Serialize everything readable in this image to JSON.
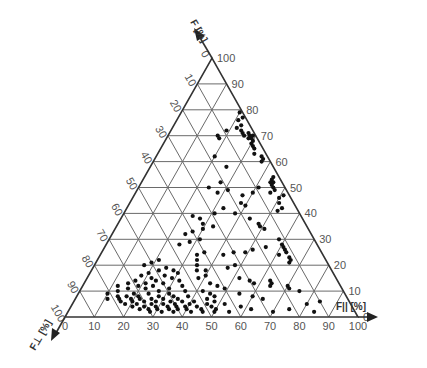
{
  "chart_data": {
    "type": "scatter",
    "subtype": "ternary",
    "title": "",
    "axes": {
      "top": {
        "label": "F",
        "subscript": "",
        "unit": "[%]",
        "ticks": [
          0,
          10,
          20,
          30,
          40,
          50,
          60,
          70,
          80,
          90,
          100
        ]
      },
      "left": {
        "label": "F",
        "subscript": "⊥",
        "unit": "[%]",
        "ticks": [
          0,
          10,
          20,
          30,
          40,
          50,
          60,
          70,
          80,
          90,
          100
        ]
      },
      "bottom": {
        "label": "F",
        "subscript": "||",
        "unit": "[%]",
        "ticks": [
          0,
          10,
          20,
          30,
          40,
          50,
          60,
          70,
          80,
          90,
          100
        ]
      }
    },
    "grid": true,
    "grid_step": 10,
    "vertices_px": {
      "left": [
        65,
        317
      ],
      "right": [
        358,
        317
      ],
      "top": [
        212,
        58
      ]
    },
    "points_note": "each point = [F_top %, F_parallel %]; F_left = 100 - F_top - F_parallel",
    "points": [
      [
        79,
        20
      ],
      [
        77,
        22
      ],
      [
        76,
        21
      ],
      [
        74,
        23
      ],
      [
        73,
        22
      ],
      [
        72,
        24
      ],
      [
        71,
        25
      ],
      [
        71,
        27
      ],
      [
        70,
        28
      ],
      [
        70,
        26
      ],
      [
        70,
        29
      ],
      [
        69,
        28
      ],
      [
        69,
        29
      ],
      [
        68,
        30
      ],
      [
        67,
        30
      ],
      [
        66,
        31
      ],
      [
        65,
        32
      ],
      [
        63,
        33
      ],
      [
        62,
        36
      ],
      [
        61,
        37
      ],
      [
        60,
        37
      ],
      [
        72,
        19
      ],
      [
        70,
        17
      ],
      [
        69,
        18
      ],
      [
        54,
        44
      ],
      [
        53,
        44
      ],
      [
        52,
        45
      ],
      [
        52,
        44
      ],
      [
        51,
        45
      ],
      [
        50,
        46
      ],
      [
        49,
        47
      ],
      [
        48,
        46
      ],
      [
        47,
        51
      ],
      [
        46,
        50
      ],
      [
        44,
        51
      ],
      [
        42,
        53
      ],
      [
        41,
        52
      ],
      [
        50,
        41
      ],
      [
        48,
        40
      ],
      [
        47,
        37
      ],
      [
        44,
        38
      ],
      [
        43,
        40
      ],
      [
        42,
        33
      ],
      [
        40,
        38
      ],
      [
        38,
        44
      ],
      [
        36,
        48
      ],
      [
        35,
        49
      ],
      [
        34,
        51
      ],
      [
        30,
        58
      ],
      [
        28,
        60
      ],
      [
        27,
        61
      ],
      [
        26,
        62
      ],
      [
        25,
        63
      ],
      [
        24,
        61
      ],
      [
        23,
        65
      ],
      [
        22,
        66
      ],
      [
        21,
        66
      ],
      [
        27,
        55
      ],
      [
        26,
        51
      ],
      [
        25,
        49
      ],
      [
        25,
        45
      ],
      [
        24,
        42
      ],
      [
        20,
        48
      ],
      [
        19,
        46
      ],
      [
        15,
        52
      ],
      [
        14,
        56
      ],
      [
        13,
        58
      ],
      [
        14,
        63
      ],
      [
        13,
        64
      ],
      [
        12,
        70
      ],
      [
        11,
        71
      ],
      [
        10,
        75
      ],
      [
        12,
        64
      ],
      [
        18,
        39
      ],
      [
        62,
        20
      ],
      [
        58,
        26
      ],
      [
        52,
        27
      ],
      [
        50,
        24
      ],
      [
        49,
        31
      ],
      [
        48,
        28
      ],
      [
        40,
        31
      ],
      [
        39,
        24
      ],
      [
        38,
        27
      ],
      [
        36,
        29
      ],
      [
        35,
        33
      ],
      [
        34,
        30
      ],
      [
        33,
        27
      ],
      [
        32,
        25
      ],
      [
        30,
        31
      ],
      [
        29,
        28
      ],
      [
        28,
        25
      ],
      [
        25,
        35
      ],
      [
        24,
        33
      ],
      [
        22,
        34
      ],
      [
        20,
        35
      ],
      [
        18,
        36
      ],
      [
        16,
        40
      ],
      [
        15,
        38
      ],
      [
        22,
        21
      ],
      [
        21,
        19
      ],
      [
        20,
        17
      ],
      [
        19,
        25
      ],
      [
        18,
        23
      ],
      [
        18,
        28
      ],
      [
        17,
        20
      ],
      [
        17,
        30
      ],
      [
        16,
        18
      ],
      [
        16,
        26
      ],
      [
        15,
        22
      ],
      [
        15,
        29
      ],
      [
        14,
        17
      ],
      [
        14,
        24
      ],
      [
        14,
        32
      ],
      [
        13,
        15
      ],
      [
        13,
        21
      ],
      [
        13,
        27
      ],
      [
        12,
        12
      ],
      [
        12,
        19
      ],
      [
        12,
        24
      ],
      [
        12,
        34
      ],
      [
        11,
        16
      ],
      [
        11,
        22
      ],
      [
        11,
        30
      ],
      [
        10,
        13
      ],
      [
        10,
        27
      ],
      [
        10,
        36
      ],
      [
        9,
        10
      ],
      [
        9,
        19
      ],
      [
        9,
        24
      ],
      [
        9,
        31
      ],
      [
        8,
        14
      ],
      [
        8,
        17
      ],
      [
        8,
        21
      ],
      [
        8,
        28
      ],
      [
        8,
        33
      ],
      [
        8,
        38
      ],
      [
        7,
        11
      ],
      [
        7,
        15
      ],
      [
        7,
        19
      ],
      [
        7,
        22
      ],
      [
        7,
        26
      ],
      [
        7,
        30
      ],
      [
        7,
        35
      ],
      [
        6,
        16
      ],
      [
        6,
        20
      ],
      [
        6,
        24
      ],
      [
        6,
        28
      ],
      [
        6,
        33
      ],
      [
        6,
        37
      ],
      [
        6,
        41
      ],
      [
        5,
        18
      ],
      [
        5,
        22
      ],
      [
        5,
        27
      ],
      [
        5,
        31
      ],
      [
        5,
        35
      ],
      [
        5,
        40
      ],
      [
        4,
        21
      ],
      [
        4,
        25
      ],
      [
        4,
        29
      ],
      [
        4,
        33
      ],
      [
        4,
        36
      ],
      [
        4,
        39
      ],
      [
        4,
        43
      ],
      [
        3,
        24
      ],
      [
        3,
        27
      ],
      [
        3,
        30
      ],
      [
        3,
        34
      ],
      [
        3,
        37
      ],
      [
        3,
        40
      ],
      [
        3,
        45
      ],
      [
        2,
        28
      ],
      [
        2,
        32
      ],
      [
        2,
        36
      ],
      [
        2,
        42
      ],
      [
        2,
        46
      ],
      [
        2,
        50
      ],
      [
        2,
        55
      ],
      [
        13,
        43
      ],
      [
        12,
        46
      ],
      [
        11,
        49
      ],
      [
        10,
        42
      ],
      [
        9,
        45
      ],
      [
        8,
        47
      ],
      [
        7,
        45
      ],
      [
        6,
        48
      ],
      [
        5,
        52
      ],
      [
        5,
        46
      ],
      [
        4,
        48
      ],
      [
        3,
        50
      ],
      [
        9,
        55
      ],
      [
        8,
        60
      ],
      [
        7,
        64
      ],
      [
        4,
        58
      ],
      [
        3,
        62
      ],
      [
        2,
        70
      ],
      [
        3,
        75
      ],
      [
        5,
        80
      ],
      [
        6,
        84
      ],
      [
        2,
        84
      ]
    ]
  }
}
